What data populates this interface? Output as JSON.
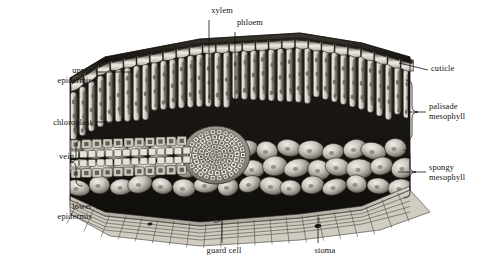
{
  "figure": {
    "style": "grayscale halftone scientific illustration",
    "background_color": "#ffffff",
    "ink_color": "#14110e"
  },
  "labels": {
    "upper_epidermis": "upper\nepidermis",
    "upper_epidermis_l1": "upper",
    "upper_epidermis_l2": "epidermis",
    "chloroplast": "chloroplast",
    "vein": "vein",
    "lower_epidermis_l1": "lower",
    "lower_epidermis_l2": "epidermis",
    "xylem": "xylem",
    "phloem": "phloem",
    "guard_cell": "guard cell",
    "stoma": "stoma",
    "cuticle": "cuticle",
    "palisade_l1": "palisade",
    "palisade_l2": "mesophyll",
    "spongy_l1": "spongy",
    "spongy_l2": "mesophyll"
  },
  "leader_lines": {
    "upper_epidermis": {
      "from": [
        95,
        72
      ],
      "to": [
        128,
        72
      ]
    },
    "chloroplast": {
      "from": [
        96,
        122
      ],
      "to": [
        124,
        122
      ]
    },
    "lower_epidermis": {
      "from": [
        96,
        208
      ],
      "to": [
        128,
        208
      ]
    },
    "xylem": {
      "from": [
        209,
        20
      ],
      "to": [
        209,
        100
      ]
    },
    "phloem": {
      "from": [
        235,
        32
      ],
      "to": [
        235,
        120
      ]
    },
    "guard_cell": {
      "from": [
        222,
        244
      ],
      "to": [
        222,
        208
      ]
    },
    "stoma": {
      "from": [
        318,
        244
      ],
      "to": [
        318,
        214
      ]
    },
    "cuticle": {
      "from": [
        428,
        70
      ],
      "to": [
        404,
        64
      ]
    },
    "palisade": {
      "from": [
        426,
        112
      ],
      "to": [
        408,
        112
      ]
    },
    "spongy": {
      "from": [
        426,
        172
      ],
      "to": [
        400,
        172
      ]
    }
  },
  "brackets": {
    "vein": {
      "x": 76,
      "y_top": 140,
      "y_bottom": 186,
      "side": "right"
    },
    "palisade": {
      "x": 412,
      "y_top": 80,
      "y_bottom": 140,
      "side": "left"
    },
    "spongy": {
      "x": 412,
      "y_top": 148,
      "y_bottom": 200,
      "side": "left"
    }
  },
  "tissue_layers": [
    {
      "name": "cuticle",
      "position": "outermost top surface",
      "appearance": "thin dark glossy sheet over upper epidermis"
    },
    {
      "name": "upper epidermis",
      "position": "top",
      "appearance": "single row of box-like transparent cells"
    },
    {
      "name": "palisade mesophyll",
      "position": "upper interior",
      "appearance": "tall columnar cells packed vertically, containing chloroplasts"
    },
    {
      "name": "spongy mesophyll",
      "position": "lower interior",
      "appearance": "loosely packed rounded cells with large air spaces"
    },
    {
      "name": "lower epidermis",
      "position": "bottom",
      "appearance": "flat tiled cells pierced by stomata"
    },
    {
      "name": "vein",
      "position": "embedded mid-leaf",
      "appearance": "vascular bundle of xylem above phloem"
    }
  ]
}
